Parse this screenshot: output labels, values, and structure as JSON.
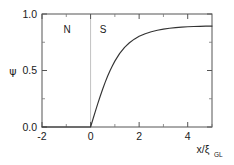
{
  "chart_data": {
    "type": "line",
    "title": "",
    "subtitle": "",
    "xlabel": "x/ξ",
    "xlabel_sub": "GL",
    "ylabel": "ψ",
    "xlim": [
      -2,
      5
    ],
    "ylim": [
      0.0,
      1.0
    ],
    "grid": false,
    "legend": false,
    "xticks": [
      -2,
      0,
      2,
      4
    ],
    "xticklabels": [
      "-2",
      "0",
      "2",
      "4"
    ],
    "xminorticks": [
      -1,
      1,
      3,
      5
    ],
    "yticks": [
      0.0,
      0.5,
      1.0
    ],
    "yticklabels": [
      "0.0",
      "0.5",
      "1.0"
    ],
    "yminorticks": [
      0.25,
      0.75
    ],
    "line_color": "#333333",
    "frame_color": "#555555",
    "divider_color": "#bbbbbb",
    "annotations": [
      {
        "label": "N",
        "x": -1.15,
        "y": 0.87,
        "name": "normal-region-label"
      },
      {
        "label": "S",
        "x": 0.35,
        "y": 0.87,
        "name": "superconducting-region-label"
      }
    ],
    "divider_x": 0,
    "equation": "psi = tanh(x / sqrt(2)) for x >= 0, else 0",
    "series": [
      {
        "name": "order-parameter",
        "x": [
          -2.0,
          -1.75,
          -1.5,
          -1.25,
          -1.0,
          -0.75,
          -0.5,
          -0.25,
          0.0,
          0.1,
          0.2,
          0.3,
          0.4,
          0.5,
          0.6,
          0.7,
          0.8,
          0.9,
          1.0,
          1.2,
          1.4,
          1.6,
          1.8,
          2.0,
          2.25,
          2.5,
          2.75,
          3.0,
          3.25,
          3.5,
          3.75,
          4.0,
          4.25,
          4.5,
          4.75,
          5.0
        ],
        "y": [
          0.0,
          0.0,
          0.0,
          0.0,
          0.0,
          0.0,
          0.0,
          0.0,
          0.0,
          0.0707,
          0.1405,
          0.2087,
          0.2742,
          0.3364,
          0.3946,
          0.4485,
          0.4979,
          0.5427,
          0.583,
          0.6513,
          0.7044,
          0.7456,
          0.7776,
          0.8024,
          0.8257,
          0.8432,
          0.8564,
          0.8663,
          0.8738,
          0.8794,
          0.8836,
          0.8868,
          0.8892,
          0.891,
          0.8923,
          0.8933
        ]
      }
    ]
  }
}
